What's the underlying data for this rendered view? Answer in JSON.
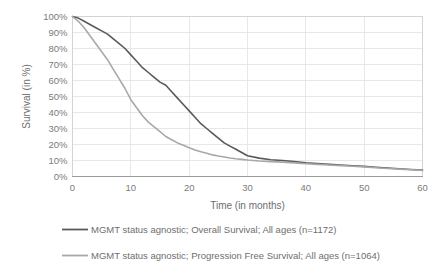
{
  "chart_data": {
    "type": "line",
    "title": "",
    "xlabel": "Time (in months)",
    "ylabel": "Survival (in %)",
    "xlim": [
      0,
      60
    ],
    "ylim": [
      0,
      100
    ],
    "grid": true,
    "legend_position": "bottom",
    "x_ticks": [
      "0",
      "10",
      "20",
      "30",
      "40",
      "50",
      "60"
    ],
    "y_ticks": [
      "0%",
      "10%",
      "20%",
      "30%",
      "40%",
      "50%",
      "60%",
      "70%",
      "80%",
      "90%",
      "100%"
    ],
    "x_tick_values": [
      0,
      10,
      20,
      30,
      40,
      50,
      60
    ],
    "y_tick_values": [
      0,
      10,
      20,
      30,
      40,
      50,
      60,
      70,
      80,
      90,
      100
    ],
    "series": [
      {
        "name": "MGMT status agnostic; Overall Survival; All ages (n=1172)",
        "color": "#5a5a5a",
        "x": [
          0,
          1,
          2,
          3,
          4,
          5,
          6,
          7,
          8,
          9,
          10,
          11,
          12,
          13,
          14,
          15,
          16,
          17,
          18,
          19,
          20,
          21,
          22,
          23,
          24,
          25,
          26,
          27,
          28,
          29,
          30,
          32,
          34,
          36,
          38,
          40,
          42,
          44,
          46,
          48,
          50,
          52,
          54,
          56,
          58,
          60
        ],
        "values": [
          100,
          99,
          97,
          95,
          93,
          91,
          89,
          86,
          83,
          80,
          76,
          72,
          68,
          65,
          62,
          59,
          57,
          53,
          49,
          45,
          41,
          37,
          33,
          30,
          27,
          24,
          21,
          19,
          17,
          15,
          13,
          11.5,
          10.5,
          10,
          9.3,
          8.6,
          8.1,
          7.6,
          7.2,
          6.7,
          6.3,
          5.8,
          5.3,
          4.8,
          4.4,
          4.0
        ]
      },
      {
        "name": "MGMT status agnostic; Progression Free Survival; All ages (n=1064)",
        "color": "#a8a8a8",
        "x": [
          0,
          1,
          2,
          3,
          4,
          5,
          6,
          7,
          8,
          9,
          10,
          11,
          12,
          13,
          14,
          15,
          16,
          17,
          18,
          19,
          20,
          21,
          22,
          23,
          24,
          25,
          26,
          27,
          28,
          29,
          30,
          32,
          34,
          36,
          38,
          40,
          42,
          44,
          46,
          48,
          50,
          52,
          54,
          56,
          58,
          60
        ],
        "values": [
          100,
          97,
          93,
          88,
          83,
          78,
          73,
          67,
          61,
          55,
          48,
          43,
          38,
          34,
          31,
          28,
          25,
          23,
          21,
          19.5,
          18,
          16.5,
          15.5,
          14.5,
          13.5,
          12.8,
          12.2,
          11.6,
          11.1,
          10.7,
          10.3,
          9.7,
          9.3,
          9.0,
          8.5,
          8.0,
          7.6,
          7.2,
          6.8,
          6.4,
          6.0,
          5.5,
          5.0,
          4.6,
          4.2,
          3.8
        ]
      }
    ],
    "legend": [
      {
        "label": "MGMT status agnostic; Overall Survival; All ages (n=1172)",
        "color": "#5a5a5a"
      },
      {
        "label": "MGMT status agnostic; Progression Free Survival; All ages (n=1064)",
        "color": "#a8a8a8"
      }
    ]
  }
}
